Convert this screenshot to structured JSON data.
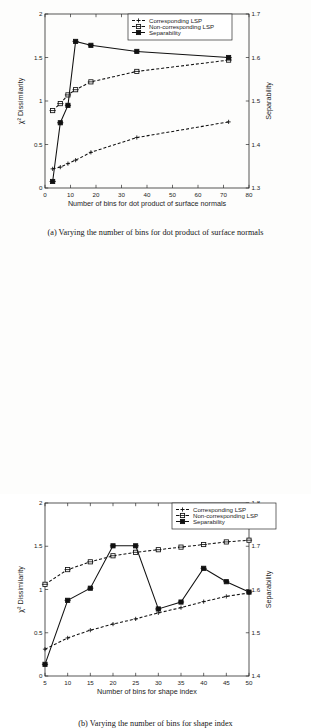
{
  "document": {
    "type": "figure-page",
    "background_color": "#fdfdfc",
    "ink_color": "#111111"
  },
  "figures": [
    {
      "id": "figure-a",
      "caption": "(a) Varying the number of bins for dot product of surface normals"
    },
    {
      "id": "figure-b",
      "caption": "(b) Varying the number of bins for shape index"
    }
  ],
  "chart_data": [
    {
      "id": "chart-a",
      "type": "line",
      "title": "",
      "xlabel": "Number of bins for dot product of surface normals",
      "ylabel": "χ² Dissimilarity",
      "y2label": "Separability",
      "xlim": [
        0,
        80
      ],
      "ylim": [
        0,
        2
      ],
      "y2lim": [
        1.3,
        1.7
      ],
      "xticks": [
        0,
        10,
        20,
        30,
        40,
        50,
        60,
        70,
        80
      ],
      "xticklabels": [
        "0",
        "10",
        "20",
        "30",
        "40",
        "50",
        "60",
        "70",
        "80"
      ],
      "yticks": [
        0,
        0.5,
        1,
        1.5,
        2
      ],
      "yticklabels": [
        "0",
        "0.5",
        "1",
        "1.5",
        "2"
      ],
      "y2ticks": [
        1.3,
        1.4,
        1.5,
        1.6,
        1.7
      ],
      "y2ticklabels": [
        "1.3",
        "1.4",
        "1.5",
        "1.6",
        "1.7"
      ],
      "grid": false,
      "legend_position": "top-center",
      "x": [
        3,
        6,
        9,
        12,
        18,
        36,
        72
      ],
      "series": [
        {
          "name": "Corresponding LSP",
          "axis": "left",
          "style": "dashed",
          "marker": "plus",
          "values": [
            0.22,
            0.24,
            0.28,
            0.32,
            0.41,
            0.58,
            0.76
          ]
        },
        {
          "name": "Non-corresponding LSP",
          "axis": "left",
          "style": "dashed",
          "marker": "square-open",
          "values": [
            0.89,
            0.97,
            1.07,
            1.13,
            1.22,
            1.34,
            1.47
          ]
        },
        {
          "name": "Separability",
          "axis": "right",
          "style": "solid",
          "marker": "square-solid",
          "values": [
            1.315,
            1.45,
            1.49,
            1.637,
            1.628,
            1.614,
            1.6
          ]
        }
      ]
    },
    {
      "id": "chart-b",
      "type": "line",
      "title": "",
      "xlabel": "Number of bins for shape index",
      "ylabel": "χ² Dissimilarity",
      "y2label": "Separability",
      "xlim": [
        5,
        50
      ],
      "ylim": [
        0,
        2
      ],
      "y2lim": [
        1.4,
        1.8
      ],
      "xticks": [
        5,
        10,
        15,
        20,
        25,
        30,
        35,
        40,
        45,
        50
      ],
      "xticklabels": [
        "5",
        "10",
        "15",
        "20",
        "25",
        "30",
        "35",
        "40",
        "45",
        "50"
      ],
      "yticks": [
        0,
        0.5,
        1,
        1.5,
        2
      ],
      "yticklabels": [
        "0",
        "0.5",
        "1",
        "1.5",
        "2"
      ],
      "y2ticks": [
        1.4,
        1.5,
        1.6,
        1.7,
        1.8
      ],
      "y2ticklabels": [
        "1.4",
        "1.5",
        "1.6",
        "1.7",
        "1.8"
      ],
      "grid": false,
      "legend_position": "top-right",
      "x": [
        5,
        10,
        15,
        20,
        25,
        30,
        35,
        40,
        45,
        50
      ],
      "series": [
        {
          "name": "Corresponding LSP",
          "axis": "left",
          "style": "dashed",
          "marker": "plus",
          "values": [
            0.31,
            0.44,
            0.53,
            0.6,
            0.66,
            0.73,
            0.79,
            0.86,
            0.92,
            0.96
          ]
        },
        {
          "name": "Non-corresponding LSP",
          "axis": "left",
          "style": "dashed",
          "marker": "square-open",
          "values": [
            1.06,
            1.23,
            1.32,
            1.39,
            1.43,
            1.46,
            1.49,
            1.52,
            1.55,
            1.57
          ]
        },
        {
          "name": "Separability",
          "axis": "right",
          "style": "solid",
          "marker": "square-solid",
          "values": [
            1.427,
            1.575,
            1.603,
            1.701,
            1.701,
            1.555,
            1.571,
            1.649,
            1.618,
            1.594
          ]
        }
      ]
    }
  ],
  "legend": {
    "entries": [
      "Corresponding LSP",
      "Non-corresponding LSP",
      "Separability"
    ]
  }
}
